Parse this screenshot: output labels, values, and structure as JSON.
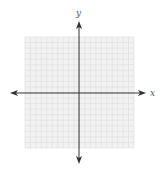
{
  "diagram": {
    "type": "coordinate-plane",
    "x_axis_label": "x",
    "y_axis_label": "y",
    "grid": {
      "columns": 20,
      "rows": 20,
      "line_color": "#dcdcdc",
      "background": "#f2f2f2"
    },
    "axis_color": "#333333"
  }
}
